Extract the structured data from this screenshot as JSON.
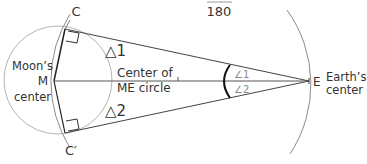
{
  "diagram": {
    "header_fragment": {
      "denominator": "180"
    },
    "points": {
      "C": "C",
      "C_prime": "C′",
      "M": "M",
      "E": "E"
    },
    "labels": {
      "moon_line1": "Moon’s",
      "moon_line2": "center",
      "earth_line1": "Earth’s",
      "earth_line2": "center",
      "me_center_line1": "Center of",
      "me_center_line2": "ME circle"
    },
    "triangles": {
      "t1": "△1",
      "t2": "△2"
    },
    "angles": {
      "a1": "∠1",
      "a2": "∠2"
    },
    "colors": {
      "line": "#333333",
      "circle": "#aaaaaa",
      "arc": "#888888",
      "angle_arc": "#111111"
    }
  }
}
